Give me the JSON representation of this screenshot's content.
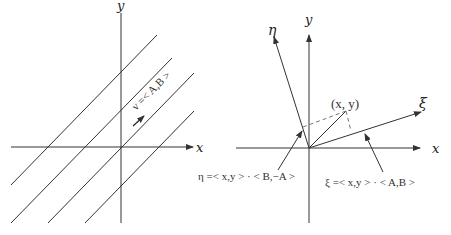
{
  "left_panel": {
    "x_axis_label": "x",
    "y_axis_label": "y",
    "vector_label": "v =< A,B >",
    "description": "Family of parallel lines with direction vector v"
  },
  "right_panel": {
    "x_axis_label": "x",
    "y_axis_label": "y",
    "eta_axis_label": "η",
    "xi_axis_label": "ξ",
    "point_label": "(x, y)",
    "eta_equation": "η =< x,y > · < B,−A >",
    "xi_equation": "ξ =< x,y > · < A,B >"
  },
  "colors": {
    "line": "#333333",
    "dashed": "#777777",
    "background": "#ffffff"
  }
}
